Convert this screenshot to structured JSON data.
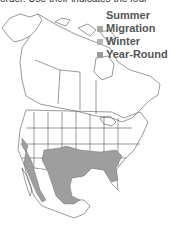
{
  "caption_fragment": "order. Use their indicates the four",
  "legend": {
    "title": "Summer",
    "items": [
      {
        "label": "Migration",
        "color": "#a8a8a8"
      },
      {
        "label": "Winter",
        "color": "#b4b4b4"
      },
      {
        "label": "Year-Round",
        "color": "#9a9a9a"
      }
    ]
  },
  "map": {
    "region": "North America",
    "range_color": "#9e9e9e",
    "outline_color": "#555555",
    "shaded_range": "Year-Round: southern United States and Mexico"
  }
}
